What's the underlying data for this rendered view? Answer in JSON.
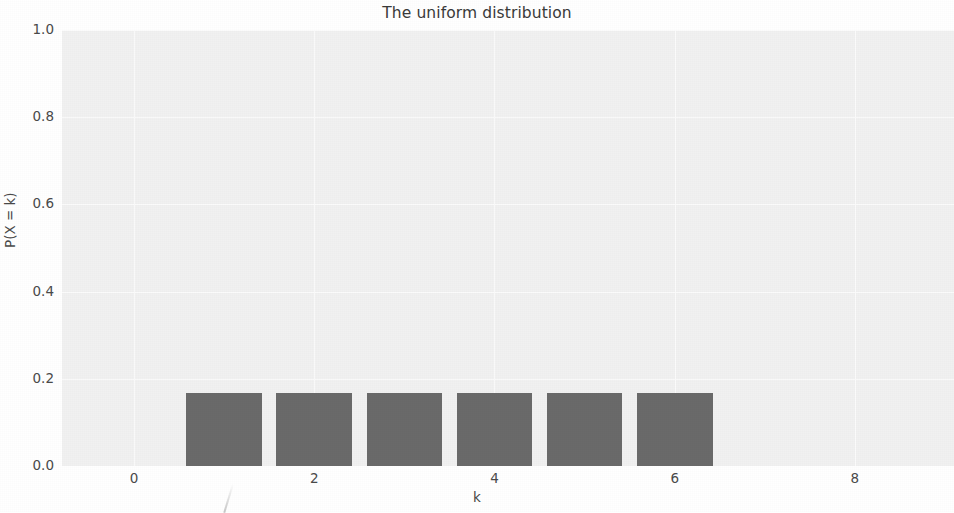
{
  "chart_data": {
    "type": "bar",
    "title": "The uniform distribution",
    "xlabel": "k",
    "ylabel": "P(X = k)",
    "categories": [
      1,
      2,
      3,
      4,
      5,
      6
    ],
    "values": [
      0.1667,
      0.1667,
      0.1667,
      0.1667,
      0.1667,
      0.1667
    ],
    "series": [
      {
        "name": "P(X = k)",
        "values": [
          0.1667,
          0.1667,
          0.1667,
          0.1667,
          0.1667,
          0.1667
        ]
      }
    ],
    "xlim": [
      -0.8,
      9.1
    ],
    "ylim": [
      0.0,
      1.0
    ],
    "xticks": [
      0,
      2,
      4,
      6,
      8
    ],
    "xtick_labels": [
      "0",
      "2",
      "4",
      "6",
      "8"
    ],
    "yticks": [
      0.0,
      0.2,
      0.4,
      0.6,
      0.8,
      1.0
    ],
    "ytick_labels": [
      "0.0",
      "0.2",
      "0.4",
      "0.6",
      "0.8",
      "1.0"
    ],
    "grid": true,
    "legend": false,
    "bar_color": "#6a6a6a",
    "plot_background": "#f1f1f1",
    "grid_color": "#fbfbfb"
  }
}
